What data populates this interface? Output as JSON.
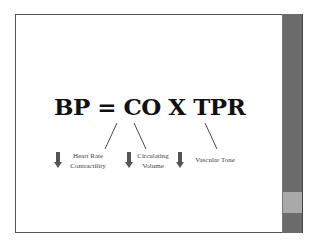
{
  "slide": {
    "equation": "BP = CO X TPR",
    "factors": [
      {
        "id": "heart-rate-contractility",
        "line1": "Heart Rate",
        "line2": "Contractility",
        "indicator": "down-arrow-icon"
      },
      {
        "id": "circulating-volume",
        "line1": "Circulating",
        "line2": "Volume",
        "indicator": "down-arrow-icon"
      },
      {
        "id": "vascular-tone",
        "line1": "Vascular Tone",
        "line2": "",
        "indicator": "down-arrow-icon"
      }
    ]
  },
  "colors": {
    "sidebar": "#6b6b6b",
    "sidebar_highlight": "#a9a9a9",
    "arrow": "#555555",
    "text": "#111111"
  }
}
